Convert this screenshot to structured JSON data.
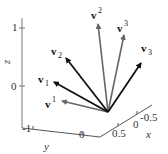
{
  "figure": {
    "title": "",
    "axes": {
      "z": {
        "label": "z",
        "ticks": [
          "1",
          "0"
        ]
      },
      "y": {
        "label": "y",
        "ticks": [
          "-1",
          "0"
        ]
      },
      "x": {
        "label": "x",
        "ticks": [
          "0.5",
          "0",
          "-0.5"
        ]
      }
    },
    "vectors": [
      {
        "name": "v_1",
        "base": "v",
        "index": "1",
        "position": "sub",
        "color": "#111111"
      },
      {
        "name": "v_2",
        "base": "v",
        "index": "2",
        "position": "sub",
        "color": "#111111"
      },
      {
        "name": "v_3",
        "base": "v",
        "index": "3",
        "position": "sub",
        "color": "#111111"
      },
      {
        "name": "v^1",
        "base": "v",
        "index": "1",
        "position": "sup",
        "color": "#666666"
      },
      {
        "name": "v^2",
        "base": "v",
        "index": "2",
        "position": "sup",
        "color": "#666666"
      },
      {
        "name": "v^3",
        "base": "v",
        "index": "3",
        "position": "sup",
        "color": "#666666"
      }
    ],
    "colors": {
      "basis": "#111111",
      "dual_basis": "#666666",
      "axis": "#555555"
    }
  }
}
